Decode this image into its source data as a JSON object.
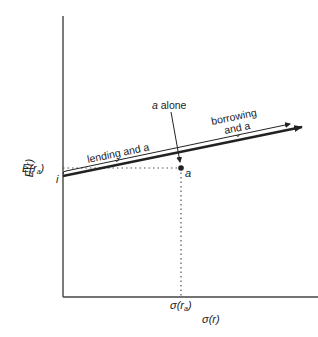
{
  "diagram": {
    "type": "risk-return line",
    "axes": {
      "y_label": "E(r)",
      "x_label": "σ(r)"
    },
    "points": {
      "intercept": {
        "label": "i"
      },
      "portfolio": {
        "label": "a"
      }
    },
    "ticks": {
      "y_tick_label": "E(r",
      "y_tick_sub": "a",
      "y_tick_close": ")",
      "x_tick_label": "σ(r",
      "x_tick_sub": "a",
      "x_tick_close": ")"
    },
    "annotations": {
      "a_alone_italic": "a",
      "a_alone_rest": " alone",
      "lending": "lending and a",
      "borrowing_line1": "borrowing",
      "borrowing_line2": "and a"
    },
    "colors": {
      "line": "#222222",
      "dotted": "#555555",
      "axis": "#444444"
    }
  }
}
